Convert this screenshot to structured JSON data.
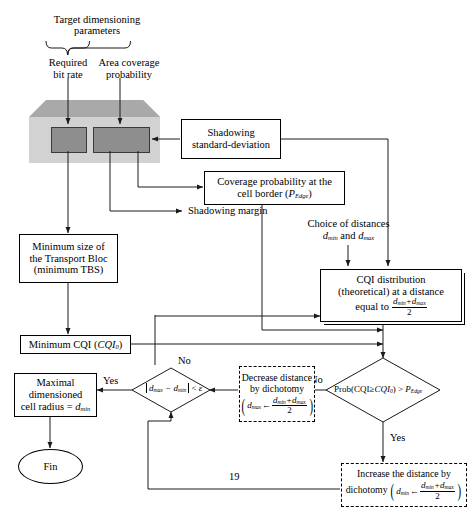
{
  "diagram": {
    "brace_label_line1": "Target dimensioning",
    "brace_label_line2": "parameters",
    "input_left_line1": "Required",
    "input_left_line2": "bit rate",
    "input_right_line1": "Area coverage",
    "input_right_line2": "probability",
    "shadowing_std_line1": "Shadowing",
    "shadowing_std_line2": "standard-deviation",
    "coverage_prob_line1": "Coverage probability at the",
    "coverage_prob_line2_pre": "cell border (",
    "coverage_prob_p": "P",
    "coverage_prob_p_sub": "Edge",
    "coverage_prob_line2_post": ")",
    "shadowing_margin": "Shadowing margin",
    "choice_dist_line1": "Choice of distances",
    "choice_dist_d1": "d",
    "choice_dist_d1_sub": "min",
    "choice_dist_and": " and ",
    "choice_dist_d2": "d",
    "choice_dist_d2_sub": "max",
    "cqi_dist_line1": "CQI distribution",
    "cqi_dist_line2": "(theoretical) at a distance",
    "cqi_dist_line3": "equal to",
    "cqi_dist_num_a": "d",
    "cqi_dist_num_a_sub": "min",
    "cqi_dist_num_plus": "+",
    "cqi_dist_num_b": "d",
    "cqi_dist_num_b_sub": "max",
    "cqi_dist_den": "2",
    "min_tbs_line1": "Minimum size of",
    "min_tbs_line2": "the Transport Bloc",
    "min_tbs_line3": "(minimum TBS)",
    "min_cqi_pre": "Minimum CQI (",
    "min_cqi_italic": "CQI",
    "min_cqi_sub": "0",
    "min_cqi_post": ")",
    "maximal_line1": "Maximal",
    "maximal_line2": "dimensioned",
    "maximal_line3_pre": "cell radius = ",
    "maximal_line3_d": "d",
    "maximal_line3_sub": "min",
    "fin": "Fin",
    "decision_eps_dmax": "d",
    "decision_eps_dmax_sub": "max",
    "decision_eps_minus": " − ",
    "decision_eps_dmin": "d",
    "decision_eps_dmin_sub": "min",
    "decision_eps_cmp": " < ",
    "decision_eps_symbol": "ε",
    "decision_prob_text": "Prob(CQI≥",
    "decision_prob_italic": "CQI",
    "decision_prob_sub": "0",
    "decision_prob_mid": ") > ",
    "decision_prob_p": "P",
    "decision_prob_p_sub": "Edge",
    "decrease_line1": "Decrease distance",
    "decrease_line2": "by dichotomy",
    "decrease_var": "d",
    "decrease_var_sub": "max",
    "decrease_arrow": "←",
    "decrease_num_a": "d",
    "decrease_num_a_sub": "min",
    "decrease_num_plus": "+",
    "decrease_num_b": "d",
    "decrease_num_b_sub": "max",
    "decrease_den": "2",
    "increase_line1": "Increase the distance by",
    "increase_line2": "dichotomy",
    "increase_var": "d",
    "increase_var_sub": "min",
    "increase_arrow": "←",
    "increase_num_a": "d",
    "increase_num_a_sub": "min",
    "increase_num_plus": "+",
    "increase_num_b": "d",
    "increase_num_b_sub": "max",
    "increase_den": "2",
    "branch_no_left": "No",
    "branch_yes_left": "Yes",
    "branch_no_right": "No",
    "branch_yes_right": "Yes",
    "loop_label": "19"
  },
  "colors": {
    "line": "#1a1a1a",
    "cube_front": "#d2d2d2",
    "cube_shade": "#a9a9a9",
    "inner_rect": "#8e8e8e",
    "background": "#ffffff"
  }
}
